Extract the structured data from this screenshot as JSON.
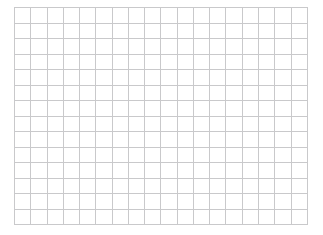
{
  "page": {
    "background_color": "#ffffff",
    "width": 323,
    "height": 235
  },
  "grid": {
    "name": "empty-table-grid",
    "columns": 18,
    "rows": 14,
    "cell_width_px": 16.3,
    "cell_height_px": 15.6,
    "line_color": "#c9c9cb",
    "line_width_px": 1,
    "cell_background_color": "#ffffff",
    "offset_left_px": 14,
    "offset_top_px": 7,
    "grid_width_px": 294,
    "grid_height_px": 218,
    "column_headers": [],
    "row_headers": [],
    "cells": [
      [
        "",
        "",
        "",
        "",
        "",
        "",
        "",
        "",
        "",
        "",
        "",
        "",
        "",
        "",
        "",
        "",
        "",
        ""
      ],
      [
        "",
        "",
        "",
        "",
        "",
        "",
        "",
        "",
        "",
        "",
        "",
        "",
        "",
        "",
        "",
        "",
        "",
        ""
      ],
      [
        "",
        "",
        "",
        "",
        "",
        "",
        "",
        "",
        "",
        "",
        "",
        "",
        "",
        "",
        "",
        "",
        "",
        ""
      ],
      [
        "",
        "",
        "",
        "",
        "",
        "",
        "",
        "",
        "",
        "",
        "",
        "",
        "",
        "",
        "",
        "",
        "",
        ""
      ],
      [
        "",
        "",
        "",
        "",
        "",
        "",
        "",
        "",
        "",
        "",
        "",
        "",
        "",
        "",
        "",
        "",
        "",
        ""
      ],
      [
        "",
        "",
        "",
        "",
        "",
        "",
        "",
        "",
        "",
        "",
        "",
        "",
        "",
        "",
        "",
        "",
        "",
        ""
      ],
      [
        "",
        "",
        "",
        "",
        "",
        "",
        "",
        "",
        "",
        "",
        "",
        "",
        "",
        "",
        "",
        "",
        "",
        ""
      ],
      [
        "",
        "",
        "",
        "",
        "",
        "",
        "",
        "",
        "",
        "",
        "",
        "",
        "",
        "",
        "",
        "",
        "",
        ""
      ],
      [
        "",
        "",
        "",
        "",
        "",
        "",
        "",
        "",
        "",
        "",
        "",
        "",
        "",
        "",
        "",
        "",
        "",
        ""
      ],
      [
        "",
        "",
        "",
        "",
        "",
        "",
        "",
        "",
        "",
        "",
        "",
        "",
        "",
        "",
        "",
        "",
        "",
        ""
      ],
      [
        "",
        "",
        "",
        "",
        "",
        "",
        "",
        "",
        "",
        "",
        "",
        "",
        "",
        "",
        "",
        "",
        "",
        ""
      ],
      [
        "",
        "",
        "",
        "",
        "",
        "",
        "",
        "",
        "",
        "",
        "",
        "",
        "",
        "",
        "",
        "",
        "",
        ""
      ],
      [
        "",
        "",
        "",
        "",
        "",
        "",
        "",
        "",
        "",
        "",
        "",
        "",
        "",
        "",
        "",
        "",
        "",
        ""
      ],
      [
        "",
        "",
        "",
        "",
        "",
        "",
        "",
        "",
        "",
        "",
        "",
        "",
        "",
        "",
        "",
        "",
        "",
        ""
      ]
    ]
  }
}
